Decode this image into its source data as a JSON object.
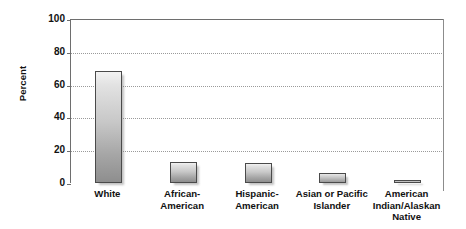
{
  "chart_data": {
    "type": "bar",
    "title": "",
    "subtitle": "",
    "xlabel": "",
    "ylabel": "Percent",
    "ylim": [
      0,
      100
    ],
    "yticks": [
      0,
      20,
      40,
      60,
      80,
      100
    ],
    "ytick_labels": [
      "0",
      "20",
      "40",
      "60",
      "80",
      "100"
    ],
    "grid": "horizontal-dotted",
    "legend": "none",
    "categories": [
      "White",
      "African-American",
      "Hispanic-American",
      "Asian or Pacific Islander",
      "American Indian/Alaskan Native"
    ],
    "category_lines": [
      [
        "White"
      ],
      [
        "African-",
        "American"
      ],
      [
        "Hispanic-",
        "American"
      ],
      [
        "Asian or Pacific",
        "Islander"
      ],
      [
        "American",
        "Indian/Alaskan",
        "Native"
      ]
    ],
    "values": [
      68,
      13,
      12,
      6,
      1
    ],
    "colors": {
      "bar_top": "#f2f2f2",
      "bar_bottom": "#8e8e8e",
      "bar_border": "#4a4a4a",
      "axis": "#6e6e6e",
      "gridline": "#9a9a9a",
      "text": "#111111",
      "background": "#ffffff"
    }
  },
  "axes": {
    "y_title": "Percent"
  }
}
